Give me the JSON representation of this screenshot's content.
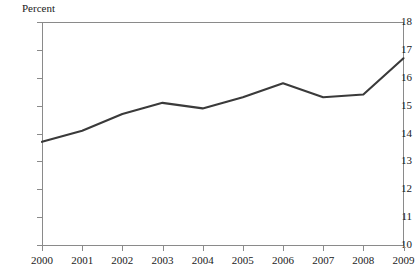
{
  "chart_data": {
    "type": "line",
    "title": "",
    "subtitle": "",
    "xlabel": "",
    "ylabel": "Percent",
    "categories": [
      "2000",
      "2001",
      "2002",
      "2003",
      "2004",
      "2005",
      "2006",
      "2007",
      "2008",
      "2009"
    ],
    "x": [
      2000,
      2001,
      2002,
      2003,
      2004,
      2005,
      2006,
      2007,
      2008,
      2009
    ],
    "values": [
      13.7,
      14.1,
      14.7,
      15.1,
      14.9,
      15.3,
      15.8,
      15.3,
      15.4,
      16.7
    ],
    "series": [
      {
        "name": "Percent",
        "values": [
          13.7,
          14.1,
          14.7,
          15.1,
          14.9,
          15.3,
          15.8,
          15.3,
          15.4,
          16.7
        ],
        "color": "#3a3a3a"
      }
    ],
    "ylim": [
      10,
      18
    ],
    "xlim": [
      2000,
      2009
    ],
    "yticks": [
      10,
      11,
      12,
      13,
      14,
      15,
      16,
      17,
      18
    ],
    "ytick_labels": [
      "10",
      "11",
      "12",
      "13",
      "14",
      "15",
      "16",
      "17",
      "18"
    ],
    "xtick_labels": [
      "2000",
      "2001",
      "2002",
      "2003",
      "2004",
      "2005",
      "2006",
      "2007",
      "2008",
      "2009"
    ],
    "grid": false,
    "legend": "none",
    "annotations": []
  },
  "axes": {
    "y_axis_title": "Percent",
    "axis_color": "#8a8a8a",
    "line_color": "#3a3a3a",
    "background": "#ffffff"
  }
}
